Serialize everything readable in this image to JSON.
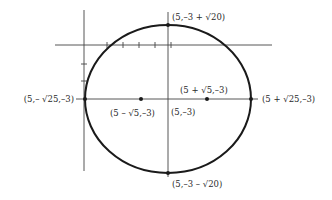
{
  "diagram": {
    "center": {
      "label": "(5,–3)"
    },
    "foci": [
      {
        "label": "(5 – √5,–3)"
      },
      {
        "label": "(5 + √5,–3)"
      }
    ],
    "vertices": {
      "left": "(5,– √25,–3)",
      "right": "(5 + √25,–3)",
      "top": "(5,–3 + √20)",
      "bottom": "(5,–3 – √20)"
    },
    "x_axis_ticks": 5,
    "y_axis_ticks": 2,
    "colors": {
      "curve": "#1a1a1a",
      "axes": "#444444",
      "text": "#2a2a2a"
    }
  }
}
